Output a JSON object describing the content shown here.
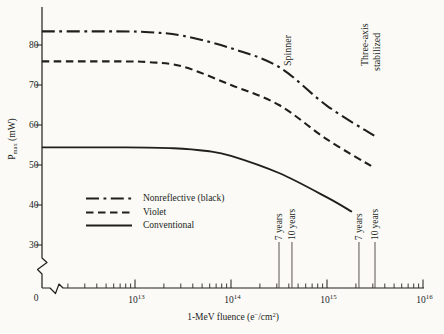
{
  "figure": {
    "paper_color": "#fbfaf6",
    "ink_color": "#211f1c",
    "has_axis_breaks": true
  },
  "chart_data": {
    "type": "line",
    "title": "",
    "xlabel": "1-MeV fluence (e−/cm2)",
    "xlabel_parts": {
      "prefix": "1-MeV fluence (e",
      "sup_minus": "−",
      "mid": "/cm",
      "sup_exp": "2",
      "suffix": ")"
    },
    "ylabel": "Pmax (mW)",
    "ylabel_parts": {
      "symbol": "P",
      "subscript": "max",
      "units": " (mW)"
    },
    "x_scale": "log",
    "x_origin_label": "0",
    "x_major_ticks": [
      {
        "base": "10",
        "exponent": "13"
      },
      {
        "base": "10",
        "exponent": "14"
      },
      {
        "base": "10",
        "exponent": "15"
      },
      {
        "base": "10",
        "exponent": "16"
      }
    ],
    "x_minor_decades": [
      12,
      13,
      14,
      15
    ],
    "y_ticks": [
      "30",
      "40",
      "50",
      "60",
      "70",
      "80"
    ],
    "ylim": [
      30,
      80
    ],
    "xlim_log": [
      12.03,
      16.01
    ],
    "legend_position": "lower-left-inside",
    "series": [
      {
        "name": "Nonreflective (black)",
        "style": "dashdot",
        "points_log10x_mw": [
          [
            12.03,
            83.4
          ],
          [
            12.8,
            83.4
          ],
          [
            13.15,
            83.2
          ],
          [
            13.5,
            82.3
          ],
          [
            14.0,
            79.2
          ],
          [
            14.5,
            74.5
          ],
          [
            15.0,
            64.8
          ],
          [
            15.5,
            57.2
          ]
        ]
      },
      {
        "name": "Violet",
        "style": "dashed",
        "points_log10x_mw": [
          [
            12.03,
            75.9
          ],
          [
            12.8,
            75.9
          ],
          [
            13.15,
            75.7
          ],
          [
            13.5,
            74.6
          ],
          [
            14.0,
            70.0
          ],
          [
            14.5,
            65.0
          ],
          [
            15.0,
            56.4
          ],
          [
            15.5,
            49.2
          ]
        ]
      },
      {
        "name": "Conventional",
        "style": "solid",
        "points_log10x_mw": [
          [
            12.03,
            54.4
          ],
          [
            12.9,
            54.4
          ],
          [
            13.4,
            54.2
          ],
          [
            13.75,
            53.5
          ],
          [
            14.0,
            52.3
          ],
          [
            14.5,
            48.0
          ],
          [
            15.0,
            41.9
          ],
          [
            15.26,
            38.3
          ]
        ]
      }
    ],
    "guide_lines": [
      {
        "label": "7 years",
        "logx": 14.5
      },
      {
        "label": "10 years",
        "logx": 14.635
      },
      {
        "label": "7 years",
        "logx": 15.333
      },
      {
        "label": "10 years",
        "logx": 15.5
      }
    ],
    "annotations": [
      {
        "text": "Spinner",
        "lines": [
          "Spinner"
        ],
        "logx": 14.625,
        "mw": 74.75
      },
      {
        "text": "Three-axis stabilized",
        "lines": [
          "Three-axis",
          "stabilized"
        ],
        "logx": 15.427,
        "mw": 74.75
      }
    ]
  },
  "legend": {
    "items": [
      {
        "label": "Nonreflective (black)",
        "style": "dashdot"
      },
      {
        "label": "Violet",
        "style": "dashed"
      },
      {
        "label": "Conventional",
        "style": "solid"
      }
    ]
  }
}
